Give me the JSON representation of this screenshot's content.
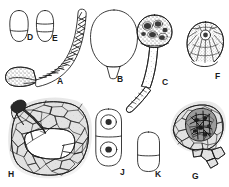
{
  "plate": {
    "title": "",
    "background_color": "#ffffff",
    "ink_color": "#1a1a1a",
    "width": 229,
    "height": 187,
    "type": "scientific-illustration-plate",
    "description": "Multi-panel line-drawing plate of fungal structures and infected host tissue sections"
  },
  "panels": [
    {
      "id": "D",
      "label": "D",
      "label_x": 27,
      "label_y": 39,
      "shape": "elongated-oval-with-septum",
      "description": "Ovoid spore with a single transverse septum in lower third",
      "cx": 19,
      "cy": 26,
      "rx": 9,
      "ry": 16,
      "septum_y": 31
    },
    {
      "id": "E",
      "label": "E",
      "label_x": 52,
      "label_y": 40,
      "shape": "elongated-oval-with-two-septa",
      "description": "Ovoid spore with two transverse septa",
      "cx": 45,
      "cy": 26,
      "rx": 8.5,
      "ry": 16,
      "septum_y": 24,
      "septum2_y": 31
    },
    {
      "id": "A",
      "label": "A",
      "label_x": 57,
      "label_y": 83,
      "shape": "curved-septate-conidium-on-stippled-base",
      "description": "Long curved multiseptate conidium with diagonal internal septa attached to a stippled bulbous basal cell"
    },
    {
      "id": "B",
      "label": "B",
      "label_x": 117,
      "label_y": 81,
      "shape": "pyriform-vesicle-with-stalk",
      "description": "Smooth pear-shaped vesicle with short tapering basal stalk"
    },
    {
      "id": "C",
      "label": "C",
      "label_x": 162,
      "label_y": 84,
      "shape": "stalked-granular-head",
      "description": "Globose granular head containing dark nuclei on a long stippled tapering stalk"
    },
    {
      "id": "F",
      "label": "F",
      "label_x": 215,
      "label_y": 78,
      "shape": "ostiolate-pycnidium",
      "description": "Rounded pycnidium in section with radiating wall cells and a central circular ostiole"
    },
    {
      "id": "H",
      "label": "H",
      "label_x": 8,
      "label_y": 178,
      "shape": "host-tissue-section-with-penetrating-hypha",
      "description": "Section of host tissue of polygonal cells with dark penetrating hypha at upper left and a clear lacuna"
    },
    {
      "id": "J",
      "label": "J",
      "label_x": 120,
      "label_y": 176,
      "shape": "two-celled-spore-with-nuclei",
      "description": "Two-celled spore, each cell with a nucleus containing a dark nucleolus"
    },
    {
      "id": "K",
      "label": "K",
      "label_x": 155,
      "label_y": 177,
      "shape": "oblong-septate-spore",
      "description": "Oblong capsule-shaped spore with a single transverse septum"
    },
    {
      "id": "G",
      "label": "G",
      "label_x": 192,
      "label_y": 180,
      "shape": "infected-tissue-with-fungal-body",
      "description": "Host tissue of polygonal cells enclosing a dark fungal fruiting body"
    }
  ],
  "unlabeled_elements": [
    {
      "id": "stalk-fragment",
      "description": "Detached stippled elongate hyphal fragment between panels C and J"
    }
  ]
}
